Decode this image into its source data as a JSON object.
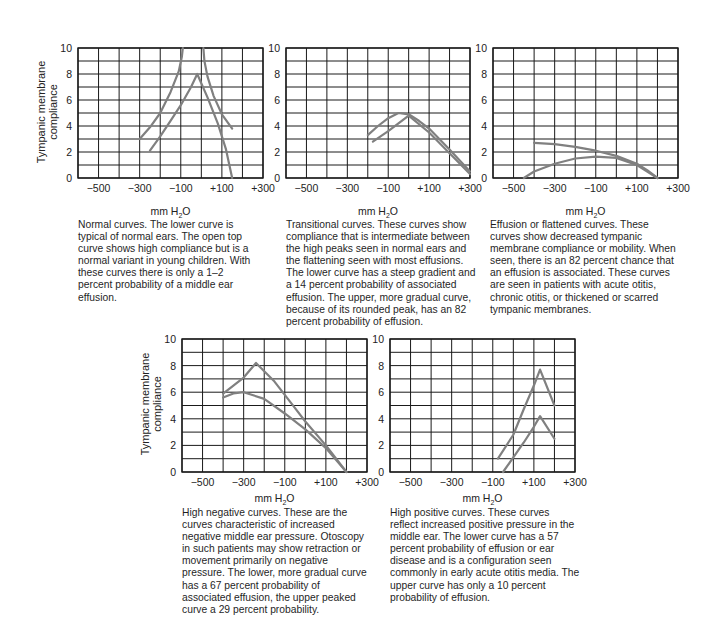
{
  "figure": {
    "ylabel_line1": "Tympanic membrane",
    "ylabel_line2": "compliance",
    "xlabel_main": "mm H",
    "xlabel_sub": "2",
    "xlabel_tail": "O",
    "xtick_labels": [
      "−500",
      "−300",
      "−100",
      "+100",
      "+300"
    ],
    "ytick_labels": [
      "0",
      "2",
      "4",
      "6",
      "8",
      "10"
    ]
  },
  "colors": {
    "grid": "#1a1a1a",
    "curve": "#808080",
    "text": "#1f1f1f"
  },
  "captions": {
    "normal": "Normal curves. The lower curve is typical of normal ears. The open top curve shows high compliance but is a normal variant in young children. With these curves there is only a 1–2 percent probability of a middle ear effusion.",
    "transitional": "Transitional curves. These curves show compliance that is intermediate between the high peaks seen in normal ears and the flattening seen with most effusions. The lower curve has a steep gradient and a 14 percent probability of associated effusion.  The upper, more gradual curve, because of its rounded peak, has an 82 percent probability of effusion.",
    "effusion": "Effusion or flattened curves. These curves show decreased tympanic membrane compliance or mobility. When seen, there is an 82 percent chance that an effusion is associated. These curves are seen in patients with acute otitis, chronic otitis, or thickened or scarred tympanic membranes.",
    "high_negative": "High negative curves. These are the curves characteristic of increased negative middle ear pressure. Otoscopy in such patients may show retraction or movement primarily on negative pressure. The lower, more gradual curve has a 67 percent probability of associated effusion, the upper peaked curve a 29 percent probability.",
    "high_positive": "High positive curves. These curves reflect increased positive pressure in the middle ear. The lower curve has a 57 percent probability of effusion or ear disease and is a configuration seen commonly in early acute otitis media. The upper curve has only a 10 percent probability of effusion."
  },
  "chart_data": [
    {
      "id": "normal",
      "type": "line",
      "title": "Normal curves",
      "xlabel": "mm H2O",
      "ylabel": "Tympanic membrane compliance",
      "xlim": [
        -600,
        300
      ],
      "ylim": [
        0,
        10
      ],
      "xticks": [
        -500,
        -300,
        -100,
        100,
        300
      ],
      "yticks": [
        0,
        2,
        4,
        6,
        8,
        10
      ],
      "grid": true,
      "series": [
        {
          "name": "open top curve (left branch)",
          "x": [
            -300,
            -250,
            -200,
            -150,
            -110,
            -95,
            -90
          ],
          "y": [
            3.0,
            3.9,
            5.0,
            6.6,
            8.2,
            9.3,
            10.0
          ]
        },
        {
          "name": "open top curve (right branch)",
          "x": [
            10,
            15,
            30,
            60,
            100,
            150
          ],
          "y": [
            10.0,
            9.0,
            7.8,
            6.3,
            4.9,
            3.8
          ]
        },
        {
          "name": "lower normal curve",
          "x": [
            -250,
            -200,
            -150,
            -100,
            -50,
            -20,
            30,
            80,
            120,
            150
          ],
          "y": [
            2.1,
            3.2,
            4.4,
            5.6,
            7.0,
            8.0,
            6.2,
            4.2,
            2.2,
            0.0
          ]
        }
      ]
    },
    {
      "id": "transitional",
      "type": "line",
      "title": "Transitional curves",
      "xlabel": "mm H2O",
      "xlim": [
        -600,
        300
      ],
      "ylim": [
        0,
        10
      ],
      "xticks": [
        -500,
        -300,
        -100,
        100,
        300
      ],
      "yticks": [
        0,
        2,
        4,
        6,
        8,
        10
      ],
      "grid": true,
      "series": [
        {
          "name": "upper rounded curve",
          "x": [
            -200,
            -150,
            -100,
            -50,
            0,
            50,
            100,
            200,
            300
          ],
          "y": [
            3.3,
            4.0,
            4.6,
            5.0,
            4.9,
            4.4,
            3.8,
            2.2,
            0.5
          ]
        },
        {
          "name": "lower steep curve",
          "x": [
            -175,
            -100,
            0,
            100,
            200,
            300
          ],
          "y": [
            2.8,
            3.6,
            4.8,
            3.5,
            1.9,
            0.3
          ]
        }
      ]
    },
    {
      "id": "effusion",
      "type": "line",
      "title": "Effusion or flattened curves",
      "xlabel": "mm H2O",
      "xlim": [
        -600,
        300
      ],
      "ylim": [
        0,
        10
      ],
      "xticks": [
        -500,
        -300,
        -100,
        100,
        300
      ],
      "yticks": [
        0,
        2,
        4,
        6,
        8,
        10
      ],
      "grid": true,
      "series": [
        {
          "name": "upper flattened curve",
          "x": [
            -400,
            -300,
            -200,
            -100,
            0,
            100,
            150,
            200
          ],
          "y": [
            2.7,
            2.6,
            2.4,
            2.1,
            1.7,
            1.1,
            0.6,
            0.0
          ]
        },
        {
          "name": "lower flattened curve",
          "x": [
            -450,
            -400,
            -300,
            -200,
            -100,
            0,
            100,
            150,
            200
          ],
          "y": [
            0.0,
            0.5,
            1.1,
            1.5,
            1.65,
            1.55,
            1.0,
            0.5,
            0.0
          ]
        }
      ]
    },
    {
      "id": "high_negative",
      "type": "line",
      "title": "High negative curves",
      "xlabel": "mm H2O",
      "ylabel": "Tympanic membrane compliance",
      "xlim": [
        -600,
        300
      ],
      "ylim": [
        0,
        10
      ],
      "xticks": [
        -500,
        -300,
        -100,
        100,
        300
      ],
      "yticks": [
        0,
        2,
        4,
        6,
        8,
        10
      ],
      "grid": true,
      "series": [
        {
          "name": "upper peaked curve",
          "x": [
            -400,
            -300,
            -240,
            -150,
            -50,
            0,
            100,
            200
          ],
          "y": [
            5.9,
            7.1,
            8.2,
            6.8,
            4.8,
            3.8,
            2.0,
            0.0
          ]
        },
        {
          "name": "lower gradual curve",
          "x": [
            -400,
            -350,
            -300,
            -200,
            -100,
            0,
            100,
            150,
            200
          ],
          "y": [
            5.6,
            5.9,
            6.0,
            5.5,
            4.4,
            3.2,
            1.8,
            0.9,
            0.0
          ]
        }
      ]
    },
    {
      "id": "high_positive",
      "type": "line",
      "title": "High positive curves",
      "xlabel": "mm H2O",
      "xlim": [
        -600,
        300
      ],
      "ylim": [
        0,
        10
      ],
      "xticks": [
        -500,
        -300,
        -100,
        100,
        300
      ],
      "yticks": [
        0,
        2,
        4,
        6,
        8,
        10
      ],
      "grid": true,
      "series": [
        {
          "name": "upper peaked curve",
          "x": [
            -75,
            0,
            50,
            100,
            130,
            200
          ],
          "y": [
            1.0,
            2.8,
            4.7,
            6.5,
            7.7,
            5.0
          ]
        },
        {
          "name": "lower peaked curve",
          "x": [
            -50,
            0,
            50,
            100,
            130,
            200
          ],
          "y": [
            0.0,
            1.1,
            2.2,
            3.4,
            4.2,
            2.5
          ]
        }
      ]
    }
  ]
}
